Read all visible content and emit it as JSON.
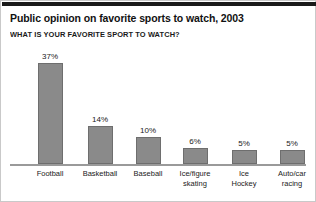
{
  "figure": {
    "title": "Public opinion on favorite sports to watch, 2003",
    "subtitle": "WHAT IS YOUR FAVORITE SPORT TO WATCH?",
    "bar_color": "#8a8a8a",
    "bar_border_color": "#6e6e6e",
    "axis_color": "#9a9a9a",
    "text_color": "#1a1a1a",
    "rule_color": "#1a1a1a",
    "border_color": "#c9c9c9"
  },
  "chart_data": {
    "type": "bar",
    "title": "Public opinion on favorite sports to watch, 2003",
    "subtitle": "WHAT IS YOUR FAVORITE SPORT TO WATCH?",
    "categories": [
      "Football",
      "Basketball",
      "Baseball",
      "Ice/figure skating",
      "Ice Hockey",
      "Auto/car racing"
    ],
    "category_lines": [
      [
        "Football"
      ],
      [
        "Basketball"
      ],
      [
        "Baseball"
      ],
      [
        "Ice/figure",
        "skating"
      ],
      [
        "Ice",
        "Hockey"
      ],
      [
        "Auto/car",
        "racing"
      ]
    ],
    "values": [
      37,
      14,
      10,
      6,
      5,
      5
    ],
    "value_labels": [
      "37%",
      "14%",
      "10%",
      "6%",
      "5%",
      "5%"
    ],
    "xlabel": "",
    "ylabel": "",
    "ylim": [
      0,
      43
    ],
    "grid": false,
    "legend": false,
    "units": "percent"
  }
}
